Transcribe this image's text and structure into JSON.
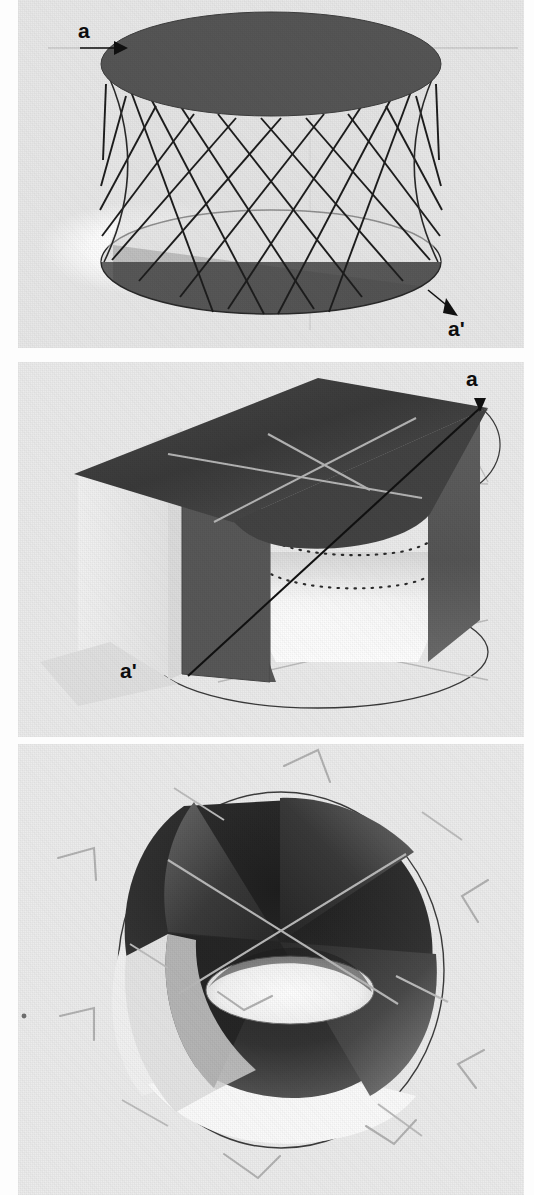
{
  "figure": {
    "kind": "three-panel mathematical illustration",
    "background_color": "#e9e9e9",
    "ink_color": "#111111",
    "panel_count": 3
  },
  "panels": [
    {
      "id": "panel-1",
      "name": "ruled-hyperboloid",
      "caption": "",
      "labels": [
        {
          "id": "a",
          "text": "a",
          "role": "point-label",
          "marker": "arrowhead-right"
        },
        {
          "id": "a2",
          "text": "a'",
          "role": "point-label",
          "marker": "arrowhead-down-right"
        }
      ],
      "elements": {
        "top_disk": "dark filled ellipse",
        "bottom_disk": "ellipse, half light half dark",
        "ruling_family_1": 11,
        "ruling_family_2": 11,
        "highlight_spot": "white elliptical highlight lower-left",
        "axis_line": "faint horizontal grey axis"
      }
    },
    {
      "id": "panel-2",
      "name": "hyperboloid-cut-by-planes",
      "caption": "",
      "labels": [
        {
          "id": "a",
          "text": "a",
          "role": "point-label",
          "marker": "arrowhead-down"
        },
        {
          "id": "a2",
          "text": "a'",
          "role": "point-label",
          "marker": "none"
        }
      ],
      "elements": {
        "top_plane": "dark quadrilateral plane",
        "left_face": "light grey vertical face",
        "right_face": "dark grey vertical face",
        "waist_circle": "dotted ellipse at the narrow waist",
        "base_circle": "thin outlined ellipse on ground plane",
        "generator_line": "straight line from a to a'",
        "axis_lines": "pale grey crossing axes"
      }
    },
    {
      "id": "panel-3",
      "name": "hyperboloid-viewed-from-above",
      "caption": "",
      "labels": [],
      "elements": {
        "outer_circle": "thin outlined ellipse (boundary)",
        "inner_throat": "white elliptical throat opening",
        "shaded_lobes": "four dark curved lobes around the throat",
        "axis_lines": "pale grey crossing axes through centre",
        "corner_marks": 8,
        "stray_speck": "small dot at far left"
      }
    }
  ],
  "strings": {
    "label_a": "a",
    "label_a_prime": "a'"
  }
}
